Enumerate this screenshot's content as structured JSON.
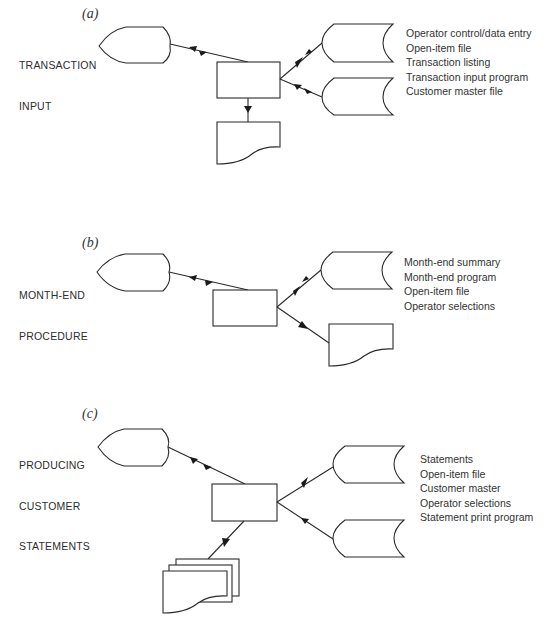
{
  "sections": [
    {
      "id": "a",
      "marker": "(a)",
      "title_lines": [
        "TRANSACTION",
        "INPUT"
      ],
      "legend": [
        "Operator control/data entry",
        "Open-item file",
        "Transaction listing",
        "Transaction input program",
        "Customer master file"
      ]
    },
    {
      "id": "b",
      "marker": "(b)",
      "title_lines": [
        "MONTH-END",
        "PROCEDURE"
      ],
      "legend": [
        "Month-end summary",
        "Month-end program",
        "Open-item file",
        "Operator selections"
      ]
    },
    {
      "id": "c",
      "marker": "(c)",
      "title_lines": [
        "PRODUCING",
        "CUSTOMER",
        "STATEMENTS"
      ],
      "legend": [
        "Statements",
        "Open-item file",
        "Customer master",
        "Operator selections",
        "Statement print program"
      ]
    }
  ],
  "symbols": {
    "display": "online display / terminal",
    "process": "process",
    "storage": "online storage",
    "document": "document",
    "multi_document": "multiple documents"
  },
  "colors": {
    "line": "#2a2a2a",
    "text": "#333333",
    "background": "#ffffff"
  }
}
